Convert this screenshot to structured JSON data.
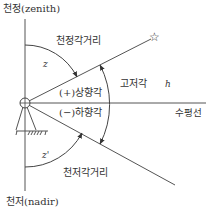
{
  "diagram": {
    "type": "angle-definitions",
    "labels": {
      "zenith": "천정(zenith)",
      "nadir": "천저(nadir)",
      "zenith_distance": "천정각거리",
      "nadir_distance": "천저각거리",
      "zenith_var": "z",
      "nadir_var": "z'",
      "elevation_angle": "고저각",
      "elevation_var": "h",
      "elevation_up": "(+)상향각",
      "elevation_down": "(−)하향각",
      "horizon": "수평선"
    },
    "symbols": {
      "target": "star-icon",
      "instrument": "theodolite-icon",
      "ground": "ground-hatch"
    },
    "colors": {
      "line": "#555555",
      "text": "#333333",
      "background": "#ffffff"
    }
  }
}
